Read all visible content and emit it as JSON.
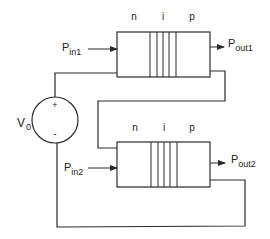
{
  "diagram": {
    "type": "circuit-schematic",
    "source": {
      "label_main": "V",
      "label_sub": "0",
      "plus": "+",
      "minus": "-"
    },
    "devices": [
      {
        "id": "device1",
        "region_labels": [
          "n",
          "i",
          "p"
        ],
        "input": {
          "label_main": "P",
          "label_sub": "in1"
        },
        "output": {
          "label_main": "P",
          "label_sub": "out1"
        }
      },
      {
        "id": "device2",
        "region_labels": [
          "n",
          "i",
          "p"
        ],
        "input": {
          "label_main": "P",
          "label_sub": "in2"
        },
        "output": {
          "label_main": "P",
          "label_sub": "out2"
        }
      }
    ],
    "colors": {
      "line": "#2a2a2a",
      "background": "#ffffff"
    }
  }
}
